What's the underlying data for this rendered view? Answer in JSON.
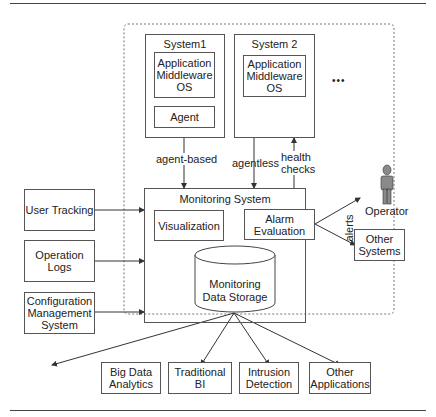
{
  "diagram": {
    "systems": [
      {
        "title": "System1",
        "stack": [
          "Application",
          "Middleware",
          "OS"
        ],
        "agent": "Agent"
      },
      {
        "title": "System 2",
        "stack": [
          "Application",
          "Middleware",
          "OS"
        ]
      }
    ],
    "ellipsis": "•••",
    "edges": {
      "agent_based": "agent-based",
      "agentless": "agentless",
      "health_checks_1": "health",
      "health_checks_2": "checks",
      "alerts": "alerts"
    },
    "monitoring": {
      "title": "Monitoring System",
      "visualization": "Visualization",
      "alarm_1": "Alarm",
      "alarm_2": "Evaluation",
      "storage_1": "Monitoring",
      "storage_2": "Data Storage"
    },
    "inputs": [
      {
        "lines": [
          "User Tracking"
        ]
      },
      {
        "lines": [
          "Operation",
          "Logs"
        ]
      },
      {
        "lines": [
          "Configuration",
          "Management",
          "System"
        ]
      }
    ],
    "operator": "Operator",
    "other_systems": [
      "Other",
      "Systems"
    ],
    "consumers": [
      {
        "lines": [
          "Big Data",
          "Analytics"
        ]
      },
      {
        "lines": [
          "Traditional BI"
        ]
      },
      {
        "lines": [
          "Intrusion",
          "Detection"
        ]
      },
      {
        "lines": [
          "Other",
          "Applications"
        ]
      }
    ]
  }
}
